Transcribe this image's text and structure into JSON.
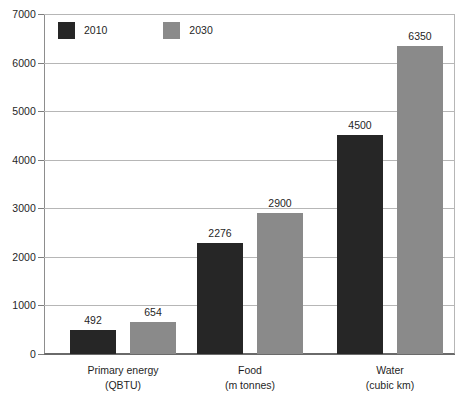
{
  "chart_data": {
    "type": "bar",
    "title": "",
    "subtitle": "",
    "xlabel": "",
    "ylabel": "",
    "ylim": [
      0,
      7000
    ],
    "ytick_values": [
      0,
      1000,
      2000,
      3000,
      4000,
      5000,
      6000,
      7000
    ],
    "ytick_labels": [
      "0",
      "1000",
      "2000",
      "3000",
      "4000",
      "5000",
      "6000",
      "7000"
    ],
    "grid": true,
    "legend_position": "top-left",
    "categories": [
      "Primary energy",
      "Food",
      "Water"
    ],
    "category_units": [
      "(QBTU)",
      "(m tonnes)",
      "(cubic km)"
    ],
    "series": [
      {
        "name": "2010",
        "color": "#262626",
        "values": [
          492,
          2276,
          4500
        ],
        "labels": [
          "492",
          "2276",
          "4500"
        ]
      },
      {
        "name": "2030",
        "color": "#8a8a8a",
        "values": [
          654,
          2900,
          6350
        ],
        "labels": [
          "654",
          "2900",
          "6350"
        ]
      }
    ]
  },
  "legend": {
    "items": [
      {
        "label": "2010",
        "color": "#262626"
      },
      {
        "label": "2030",
        "color": "#8a8a8a"
      }
    ]
  },
  "axis": {
    "y": {
      "labels": [
        "7000",
        "6000",
        "5000",
        "4000",
        "3000",
        "2000",
        "1000",
        "0"
      ]
    },
    "x": {
      "groups": [
        {
          "name": "Primary energy",
          "unit": "(QBTU)"
        },
        {
          "name": "Food",
          "unit": "(m tonnes)"
        },
        {
          "name": "Water",
          "unit": "(cubic km)"
        }
      ]
    }
  }
}
